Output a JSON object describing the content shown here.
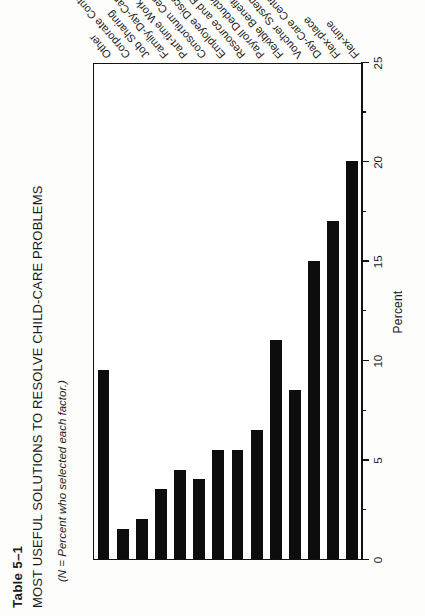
{
  "caption": {
    "table_number": "Table 5–1",
    "title": "MOST USEFUL SOLUTIONS TO RESOLVE CHILD-CARE PROBLEMS",
    "subtitle": "(N = Percent who selected each factor.)"
  },
  "chart_data": {
    "type": "bar",
    "orientation": "horizontal",
    "title": "MOST USEFUL SOLUTIONS TO RESOLVE CHILD-CARE PROBLEMS",
    "xlabel": "Percent",
    "ylabel": "",
    "xlim": [
      0,
      25
    ],
    "xticks": [
      0,
      5,
      10,
      15,
      20,
      25
    ],
    "xtick_labels": [
      "0",
      "5",
      "10",
      "15",
      "20",
      "25"
    ],
    "minor_ticks": [
      2.5,
      7.5,
      12.5,
      17.5,
      22.5
    ],
    "grid": false,
    "legend": null,
    "bar_color": "#0d0d0d",
    "categories": [
      "Flex-time",
      "Flex-place",
      "Day-Care Center",
      "Voucher System",
      "Flexible Benefits Care",
      "Payroll Deduction of Child Care",
      "Resource and Referral Services Child Care",
      "Employee Discount on Child Care",
      "Consortium Center Care",
      "Part-time Work",
      "Family-Day-Care Network",
      "Job Sharing",
      "Corporate Contributions",
      "Other"
    ],
    "values": [
      20,
      17,
      15,
      8.5,
      11,
      6.5,
      5.5,
      5.5,
      4,
      4.5,
      3.5,
      2,
      1.5,
      9.5
    ]
  }
}
